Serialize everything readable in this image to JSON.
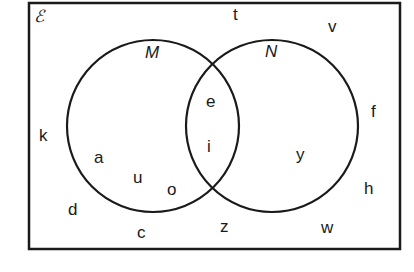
{
  "diagram": {
    "type": "venn",
    "universal_set": {
      "label": "ℰ"
    },
    "sets": [
      {
        "name": "M",
        "label": "M"
      },
      {
        "name": "N",
        "label": "N"
      }
    ],
    "regions": {
      "only_M": [
        "a",
        "u",
        "o"
      ],
      "M_and_N": [
        "e",
        "i"
      ],
      "only_N": [
        "y"
      ],
      "outside": [
        "t",
        "v",
        "k",
        "f",
        "d",
        "h",
        "c",
        "z",
        "w"
      ]
    },
    "elements": [
      {
        "id": "t",
        "label": "t"
      },
      {
        "id": "v",
        "label": "v"
      },
      {
        "id": "e",
        "label": "e"
      },
      {
        "id": "f",
        "label": "f"
      },
      {
        "id": "k",
        "label": "k"
      },
      {
        "id": "a",
        "label": "a"
      },
      {
        "id": "i",
        "label": "i"
      },
      {
        "id": "y",
        "label": "y"
      },
      {
        "id": "u",
        "label": "u"
      },
      {
        "id": "o",
        "label": "o"
      },
      {
        "id": "h",
        "label": "h"
      },
      {
        "id": "d",
        "label": "d"
      },
      {
        "id": "z",
        "label": "z"
      },
      {
        "id": "w",
        "label": "w"
      },
      {
        "id": "c",
        "label": "c"
      }
    ],
    "colors": {
      "stroke": "#1a1a1a",
      "background": "#ffffff"
    }
  }
}
